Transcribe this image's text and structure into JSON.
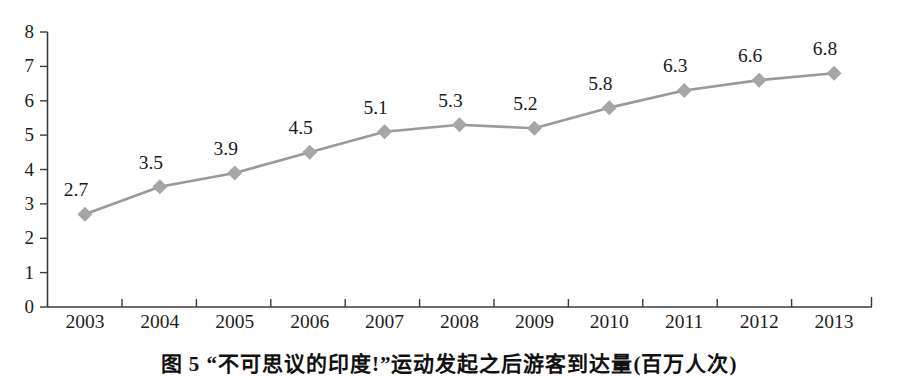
{
  "chart_data": {
    "type": "line",
    "title": "",
    "xlabel": "",
    "ylabel": "",
    "categories": [
      "2003",
      "2004",
      "2005",
      "2006",
      "2007",
      "2008",
      "2009",
      "2010",
      "2011",
      "2012",
      "2013"
    ],
    "values": [
      2.7,
      3.5,
      3.9,
      4.5,
      5.1,
      5.3,
      5.2,
      5.8,
      6.3,
      6.6,
      6.8
    ],
    "data_labels": [
      "2.7",
      "3.5",
      "3.9",
      "4.5",
      "5.1",
      "5.3",
      "5.2",
      "5.8",
      "6.3",
      "6.6",
      "6.8"
    ],
    "ylim": [
      0,
      8
    ],
    "y_ticks": [
      "0",
      "1",
      "2",
      "3",
      "4",
      "5",
      "6",
      "7",
      "8"
    ],
    "grid": false,
    "legend": "none",
    "marker": "diamond",
    "line_color": "#9a9a9a",
    "marker_color": "#a6a6a6",
    "axis_color": "#3a3a3a"
  },
  "caption": {
    "text": "图 5  “不可思议的印度!”运动发起之后游客到达量(百万人次)"
  }
}
